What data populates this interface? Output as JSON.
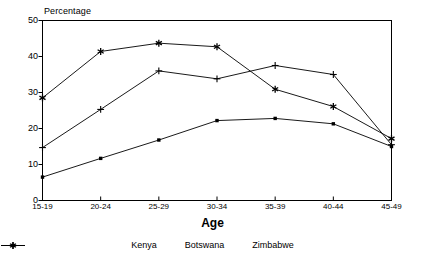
{
  "chart_data": {
    "type": "line",
    "title": "",
    "ylabel": "Percentage",
    "xlabel": "Age",
    "categories": [
      "15-19",
      "20-24",
      "25-29",
      "30-34",
      "35-39",
      "40-44",
      "45-49"
    ],
    "ylim": [
      0,
      50
    ],
    "yticks": [
      0,
      10,
      20,
      30,
      40,
      50
    ],
    "grid": false,
    "legend_position": "bottom",
    "series": [
      {
        "name": "Kenya",
        "marker": "dot",
        "color": "#000000",
        "values": [
          6.5,
          11.7,
          16.8,
          22.2,
          22.8,
          21.3,
          15.0
        ]
      },
      {
        "name": "Botswana",
        "marker": "plus",
        "color": "#000000",
        "values": [
          14.7,
          25.3,
          36.0,
          33.8,
          37.5,
          35.0,
          15.5
        ]
      },
      {
        "name": "Zimbabwe",
        "marker": "asterisk",
        "color": "#000000",
        "values": [
          28.5,
          41.4,
          43.7,
          42.7,
          30.9,
          26.1,
          17.2
        ]
      }
    ]
  },
  "axes": {
    "y_label_text": "Percentage",
    "x_label_text": "Age",
    "y_tick_labels": [
      "50",
      "40",
      "30",
      "20",
      "10",
      "0"
    ],
    "x_tick_labels": [
      "15-19",
      "20-24",
      "25-29",
      "30-34",
      "35-39",
      "40-44",
      "45-49"
    ]
  },
  "legend": {
    "items": [
      {
        "label": "Kenya",
        "marker": "dot-marker"
      },
      {
        "label": "Botswana",
        "marker": "plus-marker"
      },
      {
        "label": "Zimbabwe",
        "marker": "asterisk-marker"
      }
    ]
  },
  "colors": {
    "line": "#000000",
    "frame": "#000000",
    "background": "#ffffff"
  }
}
